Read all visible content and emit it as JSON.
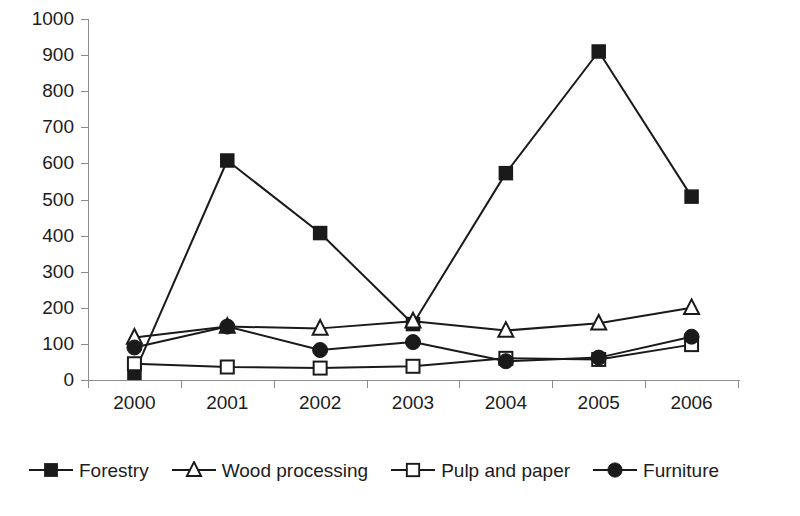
{
  "chart_data": {
    "type": "line",
    "title": "",
    "xlabel": "",
    "ylabel": "",
    "categories": [
      "2000",
      "2001",
      "2002",
      "2003",
      "2004",
      "2005",
      "2006"
    ],
    "ylim": [
      0,
      1000
    ],
    "ytick_step": 100,
    "yticks": [
      "1000",
      "900",
      "800",
      "700",
      "600",
      "500",
      "400",
      "300",
      "200",
      "100",
      "0"
    ],
    "grid": false,
    "legend_position": "bottom",
    "series": [
      {
        "name": "Forestry",
        "marker": "filled-square",
        "color": "#1a1a1a",
        "values": [
          20,
          608,
          407,
          155,
          573,
          910,
          508
        ]
      },
      {
        "name": "Wood processing",
        "marker": "open-triangle",
        "color": "#1a1a1a",
        "values": [
          118,
          148,
          143,
          163,
          137,
          157,
          200
        ]
      },
      {
        "name": "Pulp and paper",
        "marker": "open-square",
        "color": "#1a1a1a",
        "values": [
          45,
          36,
          33,
          38,
          60,
          57,
          98
        ]
      },
      {
        "name": "Furniture",
        "marker": "filled-circle",
        "color": "#1a1a1a",
        "values": [
          90,
          148,
          83,
          105,
          52,
          62,
          120
        ]
      }
    ]
  },
  "legend": {
    "items": [
      {
        "label": "Forestry",
        "marker": "filled-square"
      },
      {
        "label": "Wood processing",
        "marker": "open-triangle"
      },
      {
        "label": "Pulp and paper",
        "marker": "open-square"
      },
      {
        "label": "Furniture",
        "marker": "filled-circle"
      }
    ]
  },
  "axes": {
    "y_tick_labels": [
      "1000",
      "900",
      "800",
      "700",
      "600",
      "500",
      "400",
      "300",
      "200",
      "100",
      "0"
    ],
    "x_tick_labels": [
      "2000",
      "2001",
      "2002",
      "2003",
      "2004",
      "2005",
      "2006"
    ]
  }
}
